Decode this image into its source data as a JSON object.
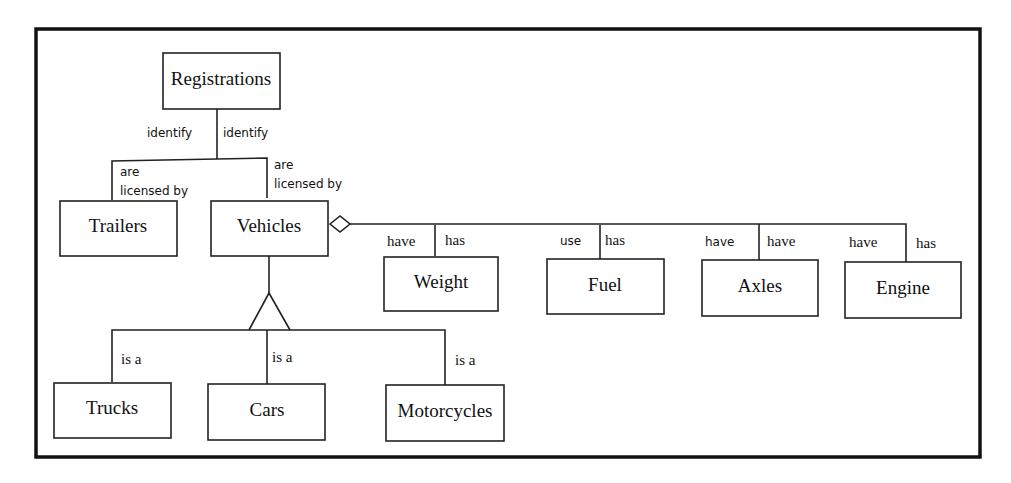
{
  "diagram": {
    "type": "entity-relationship",
    "entities": {
      "registrations": "Registrations",
      "trailers": "Trailers",
      "vehicles": "Vehicles",
      "weight": "Weight",
      "fuel": "Fuel",
      "axles": "Axles",
      "engine": "Engine",
      "trucks": "Trucks",
      "cars": "Cars",
      "motorcycles": "Motorcycles"
    },
    "relationships": [
      {
        "from": "Registrations",
        "to": "Trailers",
        "label_from": "identify",
        "label_to": "are licensed by"
      },
      {
        "from": "Registrations",
        "to": "Vehicles",
        "label_from": "identify",
        "label_to": "are licensed by"
      },
      {
        "from": "Vehicles",
        "to": "Weight",
        "label_from": "have",
        "label_to": "has",
        "kind": "aggregation"
      },
      {
        "from": "Vehicles",
        "to": "Fuel",
        "label_from": "use",
        "label_to": "has",
        "kind": "aggregation"
      },
      {
        "from": "Vehicles",
        "to": "Axles",
        "label_from": "have",
        "label_to": "have",
        "kind": "aggregation"
      },
      {
        "from": "Vehicles",
        "to": "Engine",
        "label_from": "have",
        "label_to": "has",
        "kind": "aggregation"
      },
      {
        "from": "Trucks",
        "to": "Vehicles",
        "label": "is a",
        "kind": "generalization"
      },
      {
        "from": "Cars",
        "to": "Vehicles",
        "label": "is a",
        "kind": "generalization"
      },
      {
        "from": "Motorcycles",
        "to": "Vehicles",
        "label": "is a",
        "kind": "generalization"
      }
    ],
    "labels": {
      "reg_trailers_identify": "identify",
      "reg_vehicles_identify": "identify",
      "trailers_are": "are",
      "trailers_licensed_by": "licensed by",
      "vehicles_are": "are",
      "vehicles_licensed_by": "licensed by",
      "weight_have": "have",
      "weight_has": "has",
      "fuel_use": "use",
      "fuel_has": "has",
      "axles_have_left": "have",
      "axles_have_right": "have",
      "engine_have": "have",
      "engine_has": "has",
      "trucks_is_a": "is a",
      "cars_is_a": "is a",
      "motorcycles_is_a": "is a"
    }
  }
}
